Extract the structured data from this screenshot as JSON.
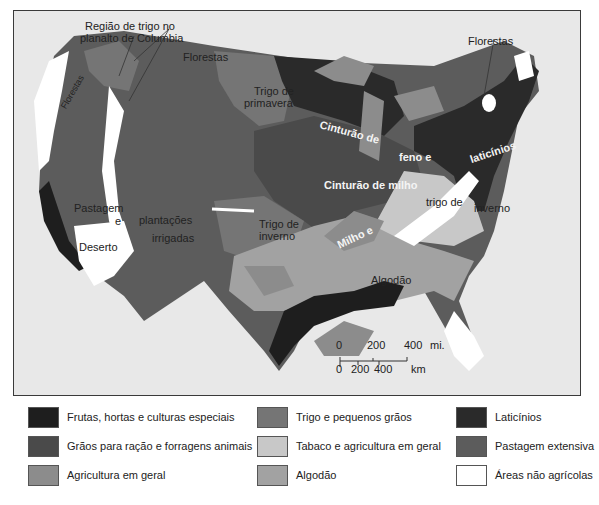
{
  "map": {
    "labels": {
      "columbia": "Região de trigo no\nplanalto de Columbia",
      "columbia_l1": "Região de trigo no",
      "columbia_l2": "planalto de Columbia",
      "florestas_nw": "Florestas",
      "florestas_coast": "Florestas",
      "florestas_ne": "Florestas",
      "trigo_primavera_l1": "Trigo de",
      "trigo_primavera_l2": "primavera",
      "cinturao_feno_1": "Cinturão de",
      "cinturao_feno_2": "feno e",
      "laticinios": "laticínios",
      "cinturao_milho": "Cinturão de milho",
      "pastagem": "Pastagem",
      "e": "e",
      "plantacoes": "plantações",
      "irrigadas": "irrigadas",
      "deserto": "Deserto",
      "trigo_inverno_l1": "Trigo de",
      "trigo_inverno_l2": "inverno",
      "milho_e": "Milho e",
      "trigo_de": "trigo de",
      "inverno": "inverno",
      "algodao": "Algodão"
    },
    "scale": {
      "mi_ticks": [
        "0",
        "200",
        "400"
      ],
      "mi_unit": "mi.",
      "km_ticks": [
        "0",
        "200",
        "400"
      ],
      "km_unit": "km"
    }
  },
  "legend": {
    "items": [
      {
        "label": "Frutas, hortas e culturas especiais",
        "color": "#1e1e1e"
      },
      {
        "label": "Grãos para ração e forragens animais",
        "color": "#4a4a4a"
      },
      {
        "label": "Agricultura em geral",
        "color": "#8c8c8c"
      },
      {
        "label": "Trigo e pequenos grãos",
        "color": "#757575"
      },
      {
        "label": "Tabaco e agricultura em geral",
        "color": "#c8c8c8"
      },
      {
        "label": "Algodão",
        "color": "#a2a2a2"
      },
      {
        "label": "Laticínios",
        "color": "#2a2a2a"
      },
      {
        "label": "Pastagem extensiva",
        "color": "#5c5c5c"
      },
      {
        "label": "Áreas não agrícolas",
        "color": "#ffffff"
      }
    ]
  }
}
